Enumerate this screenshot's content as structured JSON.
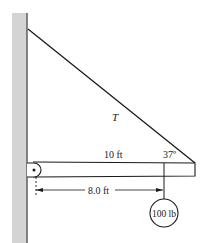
{
  "figure": {
    "type": "statics-free-body-setup",
    "labels": {
      "tension": "T",
      "beam_length": "10 ft",
      "angle": "37º",
      "load_distance": "8.0 ft",
      "load": "100 lb"
    },
    "colors": {
      "wall_fill": "#d4d4d4",
      "wall_edge": "#555555",
      "line": "#1a1a1a",
      "background": "#ffffff"
    }
  }
}
